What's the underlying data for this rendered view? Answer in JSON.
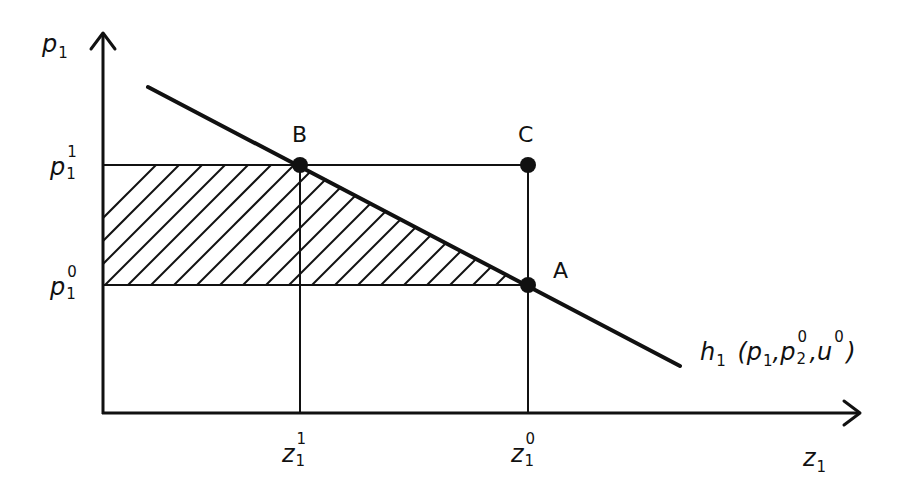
{
  "diagram": {
    "type": "economics-compensated-demand",
    "y_axis": {
      "label_base": "p",
      "label_sub": "1",
      "ticks": [
        {
          "id": "p1_1",
          "base": "p",
          "sub": "1",
          "sup": "1"
        },
        {
          "id": "p1_0",
          "base": "p",
          "sub": "1",
          "sup": "0"
        }
      ]
    },
    "x_axis": {
      "label_base": "z",
      "label_sub": "1",
      "ticks": [
        {
          "id": "z1_1",
          "base": "z",
          "sub": "1",
          "sup": "1"
        },
        {
          "id": "z1_0",
          "base": "z",
          "sub": "1",
          "sup": "0"
        }
      ]
    },
    "points": [
      {
        "label": "B",
        "at": "(z1^1, p1^1)"
      },
      {
        "label": "C",
        "at": "(z1^0, p1^1)"
      },
      {
        "label": "A",
        "at": "(z1^0, p1^0)"
      }
    ],
    "curve": {
      "name": "h1",
      "label_func": "h",
      "label_func_sub": "1",
      "label_args_open": "(",
      "arg1_base": "p",
      "arg1_sub": "1",
      "sep1": ",",
      "arg2_base": "p",
      "arg2_sub": "2",
      "arg2_sup": "0",
      "sep2": ",",
      "arg3_base": "u",
      "arg3_sup": "0",
      "label_args_close": ")"
    },
    "shaded_region": "area left of h1 between p1^0 and p1^1 (hatched)",
    "colors": {
      "ink": "#111111",
      "background": "#ffffff"
    }
  }
}
